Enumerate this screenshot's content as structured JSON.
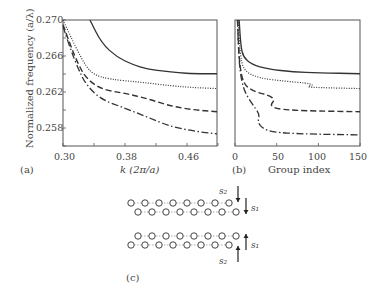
{
  "figure": {
    "panel_a_label": "(a)",
    "panel_b_label": "(b)",
    "panel_c_label": "(c)",
    "ylabel": "Normalized frequency (a/λ)",
    "xlabel_a": "k (2π/a)",
    "xlabel_b": "Group index",
    "yticks": [
      "0.270",
      "0.266",
      "0.262",
      "0.258"
    ],
    "xticks_a": [
      "0.30",
      "0.38",
      "0.46"
    ],
    "xticks_b": [
      "0",
      "50",
      "100",
      "150"
    ],
    "diagram": {
      "s1": "s₁",
      "s2": "s₂"
    }
  },
  "chart_data": [
    {
      "type": "line",
      "title": "(a)",
      "xlabel": "k (2π/a)",
      "ylabel": "Normalized frequency (a/λ)",
      "xlim": [
        0.3,
        0.5
      ],
      "ylim": [
        0.2564,
        0.27
      ],
      "series": [
        {
          "name": "solid",
          "x": [
            0.335,
            0.35,
            0.37,
            0.39,
            0.41,
            0.43,
            0.45,
            0.47,
            0.5
          ],
          "y": [
            0.27,
            0.2675,
            0.266,
            0.2652,
            0.2647,
            0.2645,
            0.2643,
            0.2642,
            0.2642
          ]
        },
        {
          "name": "dotted",
          "x": [
            0.3,
            0.31,
            0.32,
            0.33,
            0.34,
            0.36,
            0.4,
            0.44,
            0.47,
            0.5
          ],
          "y": [
            0.27,
            0.2682,
            0.2665,
            0.265,
            0.2641,
            0.2636,
            0.2633,
            0.2629,
            0.2627,
            0.2626
          ]
        },
        {
          "name": "dashed",
          "x": [
            0.3,
            0.31,
            0.32,
            0.33,
            0.35,
            0.38,
            0.41,
            0.44,
            0.47,
            0.5
          ],
          "y": [
            0.2695,
            0.2672,
            0.2652,
            0.2637,
            0.2625,
            0.2621,
            0.2615,
            0.2607,
            0.2603,
            0.2601
          ]
        },
        {
          "name": "dash-dot",
          "x": [
            0.3,
            0.31,
            0.32,
            0.33,
            0.35,
            0.38,
            0.41,
            0.44,
            0.47,
            0.5
          ],
          "y": [
            0.2693,
            0.2668,
            0.2647,
            0.263,
            0.2614,
            0.2605,
            0.2595,
            0.2585,
            0.258,
            0.2577
          ]
        }
      ]
    },
    {
      "type": "line",
      "title": "(b)",
      "xlabel": "Group index",
      "xlim": [
        0,
        150
      ],
      "ylim": [
        0.2564,
        0.27
      ],
      "series": [
        {
          "name": "solid",
          "x": [
            5,
            7,
            10,
            20,
            40,
            70,
            100,
            150
          ],
          "y": [
            0.27,
            0.2672,
            0.266,
            0.2652,
            0.2647,
            0.2644,
            0.2643,
            0.2642
          ]
        },
        {
          "name": "dotted",
          "x": [
            4,
            6,
            10,
            30,
            60,
            85,
            95,
            85,
            100,
            150
          ],
          "y": [
            0.27,
            0.2665,
            0.2645,
            0.2637,
            0.2634,
            0.2632,
            0.263,
            0.2628,
            0.2627,
            0.2626
          ]
        },
        {
          "name": "dashed",
          "x": [
            3,
            5,
            10,
            25,
            40,
            48,
            42,
            50,
            80,
            150
          ],
          "y": [
            0.27,
            0.2655,
            0.263,
            0.2622,
            0.2619,
            0.2614,
            0.2608,
            0.2604,
            0.2602,
            0.2601
          ]
        },
        {
          "name": "dash-dot",
          "x": [
            3,
            5,
            10,
            20,
            30,
            27,
            33,
            45,
            80,
            150
          ],
          "y": [
            0.27,
            0.265,
            0.2625,
            0.261,
            0.2598,
            0.259,
            0.2583,
            0.2579,
            0.2577,
            0.2576
          ]
        }
      ]
    }
  ]
}
